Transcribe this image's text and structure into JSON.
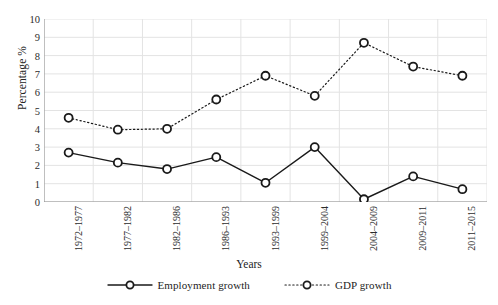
{
  "chart_data": {
    "type": "line",
    "title": "",
    "xlabel": "Years",
    "ylabel": "Percentage %",
    "categories": [
      "1972–1977",
      "1977–1982",
      "1982–1986",
      "1986–1993",
      "1993–1999",
      "1999–2004",
      "2004–2009",
      "2009–2011",
      "2011–2015"
    ],
    "series": [
      {
        "name": "Employment growth",
        "style": "solid",
        "marker": "open-circle",
        "color": "#1a1a1a",
        "values": [
          2.7,
          2.15,
          1.8,
          2.45,
          1.05,
          3.0,
          0.15,
          1.4,
          0.7
        ]
      },
      {
        "name": "GDP growth",
        "style": "dotted",
        "marker": "open-circle",
        "color": "#1a1a1a",
        "values": [
          4.6,
          3.95,
          4.0,
          5.6,
          6.9,
          5.8,
          8.7,
          7.4,
          6.9
        ]
      }
    ],
    "ylim": [
      0,
      10
    ],
    "yticks": [
      0,
      1,
      2,
      3,
      4,
      5,
      6,
      7,
      8,
      9,
      10
    ],
    "ytick_labels": [
      "0",
      "1",
      "2",
      "3",
      "4",
      "5",
      "6",
      "7",
      "8",
      "9",
      "10"
    ],
    "grid": {
      "horizontal": true,
      "vertical": true,
      "color": "#e3e3e3"
    },
    "legend_position": "bottom-center",
    "legend": [
      "Employment growth",
      "GDP growth"
    ]
  },
  "axes": {
    "y_title": "Percentage %",
    "x_title": "Years"
  },
  "legend": {
    "items": [
      {
        "label": "Employment growth",
        "dash": "none"
      },
      {
        "label": "GDP growth",
        "dash": "dotted"
      }
    ]
  },
  "colors": {
    "ink": "#1a1a1a",
    "grid": "#e3e3e3",
    "axis": "#8d8d8d",
    "background": "#ffffff"
  }
}
